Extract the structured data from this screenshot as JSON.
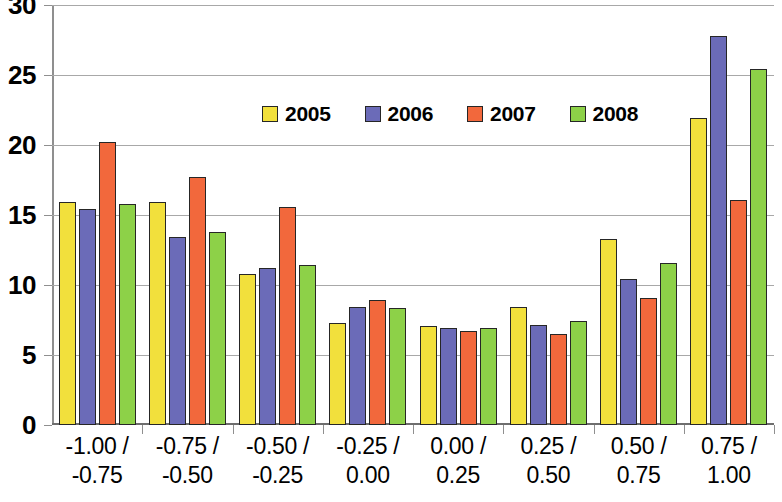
{
  "chart_data": {
    "type": "bar",
    "title": "",
    "subtitle": "",
    "xlabel": "",
    "ylabel": "",
    "ylim": [
      0,
      30
    ],
    "ytick_step": 5,
    "yticks": [
      0,
      5,
      10,
      15,
      20,
      25,
      30
    ],
    "ytick_labels": [
      "0",
      "5",
      "10",
      "15",
      "20",
      "25",
      "30"
    ],
    "grid": true,
    "legend_position": "top-center",
    "categories": [
      "-1.00 / -0.75",
      "-0.75 / -0.50",
      "-0.50 / -0.25",
      "-0.25 / 0.00",
      "0.00 / 0.25",
      "0.25 / 0.50",
      "0.50 / 0.75",
      "0.75 / 1.00"
    ],
    "category_lines": [
      [
        "-1.00 /",
        "-0.75"
      ],
      [
        "-0.75 /",
        "-0.50"
      ],
      [
        "-0.50 /",
        "-0.25"
      ],
      [
        "-0.25 /",
        "0.00"
      ],
      [
        "0.00 /",
        "0.25"
      ],
      [
        "0.25 /",
        "0.50"
      ],
      [
        "0.50 /",
        "0.75"
      ],
      [
        "0.75 /",
        "1.00"
      ]
    ],
    "series": [
      {
        "name": "2005",
        "color": "#F2E03C",
        "values": [
          15.9,
          15.9,
          10.8,
          7.3,
          7.1,
          8.4,
          13.3,
          21.9
        ]
      },
      {
        "name": "2006",
        "color": "#6B6BB8",
        "values": [
          15.4,
          13.4,
          11.2,
          8.4,
          6.9,
          7.15,
          10.4,
          27.8
        ]
      },
      {
        "name": "2007",
        "color": "#F2683C",
        "values": [
          20.2,
          17.7,
          15.6,
          8.9,
          6.7,
          6.5,
          9.1,
          16.1
        ]
      },
      {
        "name": "2008",
        "color": "#8DD148",
        "values": [
          15.8,
          13.8,
          11.4,
          8.35,
          6.9,
          7.4,
          11.6,
          25.4
        ]
      }
    ]
  },
  "legend": {
    "items": [
      {
        "label": "2005",
        "color": "#F2E03C"
      },
      {
        "label": "2006",
        "color": "#6B6BB8"
      },
      {
        "label": "2007",
        "color": "#F2683C"
      },
      {
        "label": "2008",
        "color": "#8DD148"
      }
    ]
  },
  "axis": {
    "gridline_color": "#a8a8a8",
    "axis_color": "#8f8f8f",
    "bar_outline_color": "#262626"
  }
}
